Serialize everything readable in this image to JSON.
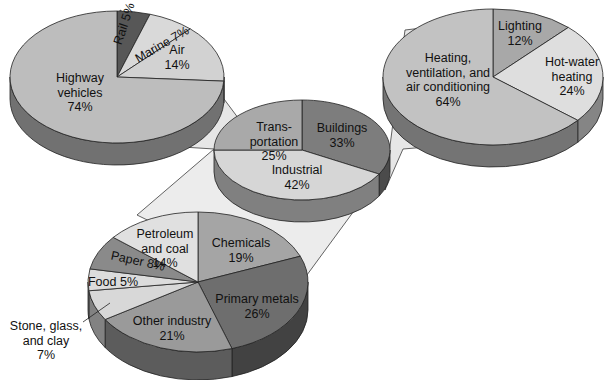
{
  "chart_data": [
    {
      "type": "pie",
      "title": "",
      "name": "Energy use by sector",
      "position": "center",
      "categories": [
        "Transportation",
        "Buildings",
        "Industrial"
      ],
      "values": [
        25,
        33,
        42
      ],
      "labels": [
        {
          "lines": [
            "Trans-",
            "portation",
            "25%"
          ]
        },
        {
          "lines": [
            "Buildings",
            "33%"
          ]
        },
        {
          "lines": [
            "Industrial",
            "42%"
          ]
        }
      ],
      "colors": [
        "#a9a9a9",
        "#7d7d7d",
        "#d6d6d6"
      ]
    },
    {
      "type": "pie",
      "name": "Transportation breakdown",
      "position": "top-left",
      "categories": [
        "Highway vehicles",
        "Rail",
        "Marine",
        "Air"
      ],
      "values": [
        74,
        5,
        7,
        14
      ],
      "labels": [
        {
          "lines": [
            "Highway",
            "vehicles",
            "74%"
          ]
        },
        {
          "lines": [
            "Rail 5%"
          ]
        },
        {
          "lines": [
            "Marine 7%"
          ]
        },
        {
          "lines": [
            "Air",
            "14%"
          ]
        }
      ],
      "colors": [
        "#bdbdbd",
        "#575757",
        "#d9d9d9",
        "#d2d2d2"
      ]
    },
    {
      "type": "pie",
      "name": "Buildings breakdown",
      "position": "top-right",
      "categories": [
        "Heating, ventilation, and air conditioning",
        "Lighting",
        "Hot-water heating"
      ],
      "values": [
        64,
        12,
        24
      ],
      "labels": [
        {
          "lines": [
            "Heating,",
            "ventilation, and",
            "air conditioning",
            "64%"
          ]
        },
        {
          "lines": [
            "Lighting",
            "12%"
          ]
        },
        {
          "lines": [
            "Hot-water",
            "heating",
            "24%"
          ]
        }
      ],
      "colors": [
        "#c2c2c2",
        "#a8a8a8",
        "#dedede"
      ]
    },
    {
      "type": "pie",
      "name": "Industrial breakdown",
      "position": "bottom-left",
      "categories": [
        "Chemicals",
        "Primary metals",
        "Other industry",
        "Stone, glass, and clay",
        "Food",
        "Paper",
        "Petroleum and coal"
      ],
      "values": [
        19,
        26,
        21,
        7,
        5,
        8,
        14
      ],
      "labels": [
        {
          "lines": [
            "Chemicals",
            "19%"
          ]
        },
        {
          "lines": [
            "Primary metals",
            "26%"
          ]
        },
        {
          "lines": [
            "Other industry",
            "21%"
          ]
        },
        {
          "lines": [
            "Stone, glass,",
            "and clay",
            "7%"
          ]
        },
        {
          "lines": [
            "Food 5%"
          ]
        },
        {
          "lines": [
            "Paper 8%"
          ]
        },
        {
          "lines": [
            "Petroleum",
            "and coal",
            "14%"
          ]
        }
      ],
      "colors": [
        "#a5a5a5",
        "#6e6e6e",
        "#9a9a9a",
        "#d8d8d8",
        "#dcdcdc",
        "#8a8a8a",
        "#e0e0e0"
      ]
    }
  ],
  "style": {
    "background": "#ffffff",
    "connector_fill": "#e4e4e4",
    "depth_shade": "#7a7a7a",
    "edge_color": "#222222"
  }
}
